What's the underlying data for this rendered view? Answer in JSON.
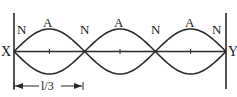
{
  "diagram": {
    "ends": {
      "left": "X",
      "right": "Y"
    },
    "loops": 3,
    "node_label": "N",
    "antinode_label": "A",
    "node_labels": [
      "N",
      "N",
      "N",
      "N"
    ],
    "antinode_labels": [
      "A",
      "A",
      "A"
    ],
    "dimension": {
      "label": "l/3",
      "spans_loops": 1
    },
    "colors": {
      "stroke": "#2a2a2a",
      "background": "#ffffff"
    }
  }
}
